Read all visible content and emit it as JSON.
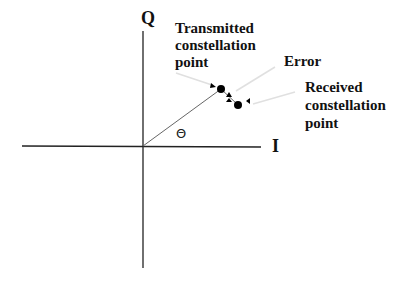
{
  "diagram": {
    "type": "IQ constellation diagram",
    "axes": {
      "horizontal_label": "I",
      "vertical_label": "Q"
    },
    "angle_label": "Θ",
    "annotations": {
      "transmitted_line1": "Transmitted",
      "transmitted_line2": "constellation",
      "transmitted_line3": "point",
      "error": "Error",
      "received_line1": "Received",
      "received_line2": "constellation",
      "received_line3": "point"
    },
    "colors": {
      "axis": "#222222",
      "vector": "#555555",
      "points": "#000000",
      "leader_lines": "#dddddd"
    }
  }
}
